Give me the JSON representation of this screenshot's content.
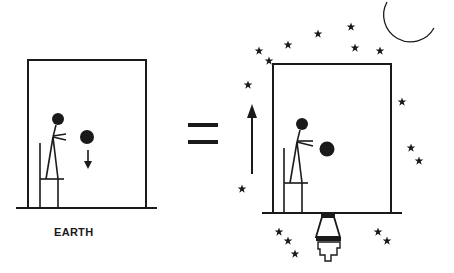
{
  "diagram": {
    "left_panel": {
      "label": "EARTH",
      "description": "Person standing on a chair in a room on Earth drops a ball that falls downward",
      "ball_motion": "down"
    },
    "operator": "=",
    "right_panel": {
      "label": "",
      "description": "Person in an accelerating rocket-powered box in space drops a ball; box accelerates upward",
      "box_motion": "up",
      "elements": [
        "stars",
        "crescent-moon",
        "rocket-engine"
      ]
    }
  },
  "colors": {
    "ink": "#1a1a1a",
    "background": "#ffffff"
  }
}
